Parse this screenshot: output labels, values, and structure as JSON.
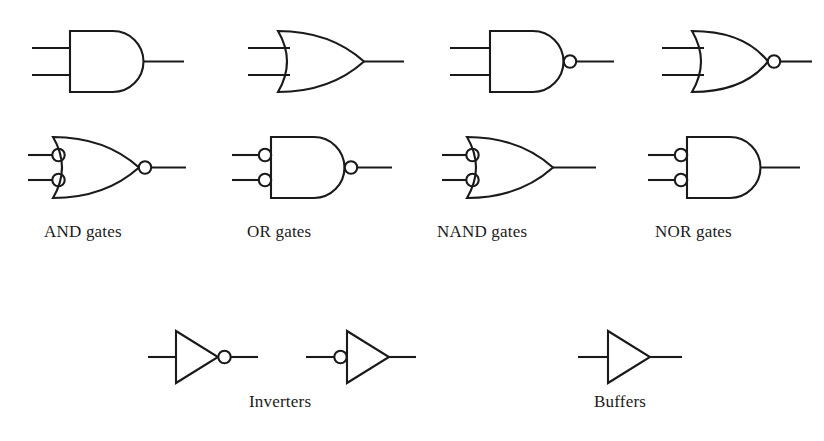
{
  "figure": {
    "background_color": "#ffffff",
    "line_color": "#1a1a1a",
    "title": ""
  },
  "labels": {
    "and": "AND gates",
    "or": "OR gates",
    "nand": "NAND gates",
    "nor": "NOR gates",
    "inverters": "Inverters",
    "buffers": "Buffers"
  },
  "columns": [
    {
      "id": "and",
      "label": "AND gates",
      "forms": [
        {
          "row": 1,
          "shape": "and-shape",
          "input_bubbles": false,
          "output_bubble": false,
          "inputs": 2
        },
        {
          "row": 2,
          "shape": "or-shape",
          "input_bubbles": true,
          "output_bubble": true,
          "inputs": 2
        }
      ]
    },
    {
      "id": "or",
      "label": "OR gates",
      "forms": [
        {
          "row": 1,
          "shape": "or-shape",
          "input_bubbles": false,
          "output_bubble": false,
          "inputs": 2
        },
        {
          "row": 2,
          "shape": "and-shape",
          "input_bubbles": true,
          "output_bubble": true,
          "inputs": 2
        }
      ]
    },
    {
      "id": "nand",
      "label": "NAND gates",
      "forms": [
        {
          "row": 1,
          "shape": "and-shape",
          "input_bubbles": false,
          "output_bubble": true,
          "inputs": 2
        },
        {
          "row": 2,
          "shape": "or-shape",
          "input_bubbles": true,
          "output_bubble": false,
          "inputs": 2
        }
      ]
    },
    {
      "id": "nor",
      "label": "NOR gates",
      "forms": [
        {
          "row": 1,
          "shape": "or-shape",
          "input_bubbles": false,
          "output_bubble": true,
          "inputs": 2
        },
        {
          "row": 2,
          "shape": "and-shape",
          "input_bubbles": true,
          "output_bubble": false,
          "inputs": 2
        }
      ]
    }
  ],
  "bottom_section": [
    {
      "id": "inverters",
      "label": "Inverters",
      "symbols": [
        {
          "shape": "triangle",
          "bubble_side": "output",
          "inputs": 1
        },
        {
          "shape": "triangle",
          "bubble_side": "input",
          "inputs": 1
        }
      ]
    },
    {
      "id": "buffers",
      "label": "Buffers",
      "symbols": [
        {
          "shape": "triangle",
          "bubble_side": "none",
          "inputs": 1
        }
      ]
    }
  ]
}
